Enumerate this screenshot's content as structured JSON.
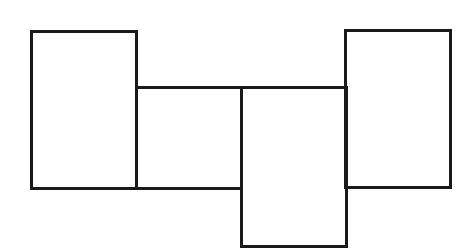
{
  "diagram": {
    "type": "rectangle-arrangement",
    "stroke_color": "#1a1a1a",
    "background": "#ffffff",
    "shapes": [
      {
        "id": "rect-1",
        "x": 30,
        "y": 30,
        "width": 108,
        "height": 160
      },
      {
        "id": "rect-2",
        "x": 135,
        "y": 86,
        "width": 108,
        "height": 104
      },
      {
        "id": "rect-3",
        "x": 240,
        "y": 86,
        "width": 108,
        "height": 162
      },
      {
        "id": "rect-4",
        "x": 344,
        "y": 29,
        "width": 108,
        "height": 160
      }
    ]
  }
}
